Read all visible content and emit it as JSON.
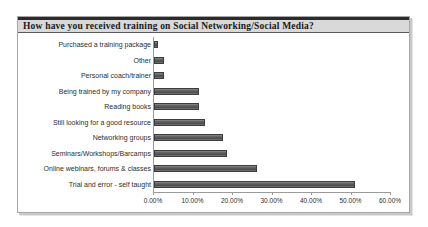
{
  "chart_data": {
    "type": "bar",
    "orientation": "horizontal",
    "title": "How have you received training on Social Networking/Social Media?",
    "xlabel": "",
    "ylabel": "",
    "xlim": [
      0,
      60
    ],
    "grid": false,
    "legend": null,
    "bar_color": "#5e5e5e",
    "tick_labels": [
      "0.00%",
      "10.00%",
      "20.00%",
      "30.00%",
      "40.00%",
      "50.00%",
      "60.00%"
    ],
    "tick_values": [
      0,
      10,
      20,
      30,
      40,
      50,
      60
    ],
    "categories": [
      "Purchased a training package",
      "Other",
      "Personal coach/trainer",
      "Being trained by my company",
      "Reading books",
      "Still looking for a good resource",
      "Networking groups",
      "Seminars/Workshops/Barcamps",
      "Online webinars, forums & classes",
      "Trial and error - self taught"
    ],
    "values": [
      1.0,
      2.5,
      2.5,
      11.5,
      11.5,
      13.0,
      17.5,
      18.5,
      26.0,
      51.0
    ]
  }
}
